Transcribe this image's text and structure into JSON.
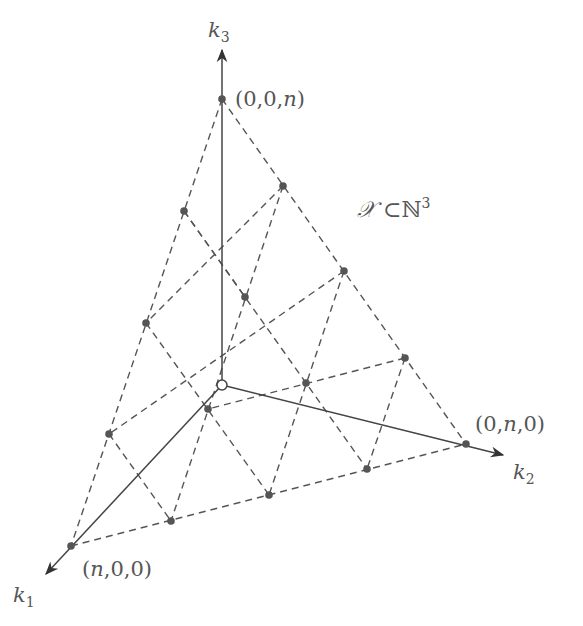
{
  "diagram": {
    "title_set": {
      "script": "𝒳",
      "subset": "⊂",
      "field": "ℕ",
      "exponent": "3"
    },
    "axes": [
      {
        "name": "k1",
        "base": "k",
        "sub": "1"
      },
      {
        "name": "k2",
        "base": "k",
        "sub": "2"
      },
      {
        "name": "k3",
        "base": "k",
        "sub": "3"
      }
    ],
    "vertex_labels": {
      "k3_vertex": "(0,0,n)",
      "k2_vertex": "(0,n,0)",
      "k1_vertex": "(n,0,0)"
    },
    "colors": {
      "line": "#555555",
      "point": "#555555",
      "background": "#ffffff"
    },
    "origin": [
      222,
      385
    ],
    "axis_ends": {
      "k1": [
        46,
        574
      ],
      "k2": [
        503,
        455
      ],
      "k3": [
        222,
        50
      ]
    },
    "points": [
      [
        222,
        99
      ],
      [
        283,
        186
      ],
      [
        344,
        271
      ],
      [
        405,
        358
      ],
      [
        466,
        444
      ],
      [
        184,
        211
      ],
      [
        245,
        297
      ],
      [
        306,
        383
      ],
      [
        367,
        469
      ],
      [
        146,
        323
      ],
      [
        208,
        409
      ],
      [
        269,
        495
      ],
      [
        109,
        434
      ],
      [
        171,
        521
      ],
      [
        71,
        546
      ]
    ],
    "dashed_lines": [
      [
        [
          222,
          99
        ],
        [
          71,
          546
        ]
      ],
      [
        [
          222,
          99
        ],
        [
          466,
          444
        ]
      ],
      [
        [
          71,
          546
        ],
        [
          466,
          444
        ]
      ],
      [
        [
          283,
          186
        ],
        [
          171,
          521
        ]
      ],
      [
        [
          344,
          271
        ],
        [
          269,
          495
        ]
      ],
      [
        [
          405,
          358
        ],
        [
          367,
          469
        ]
      ],
      [
        [
          184,
          211
        ],
        [
          367,
          469
        ]
      ],
      [
        [
          146,
          323
        ],
        [
          269,
          495
        ]
      ],
      [
        [
          109,
          434
        ],
        [
          171,
          521
        ]
      ],
      [
        [
          184,
          211
        ],
        [
          245,
          297
        ]
      ],
      [
        [
          283,
          186
        ],
        [
          146,
          323
        ]
      ],
      [
        [
          344,
          271
        ],
        [
          109,
          434
        ]
      ],
      [
        [
          405,
          358
        ],
        [
          208,
          409
        ]
      ]
    ]
  }
}
